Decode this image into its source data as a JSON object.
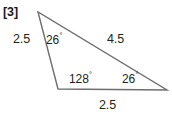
{
  "figure": {
    "index_label": "[3]",
    "shape": "triangle",
    "stroke_color": "#6d6e71",
    "text_color": "#231f20",
    "background_color": "#ffffff",
    "vertices": {
      "apex": [
        38,
        12
      ],
      "bottom_left": [
        58,
        89
      ],
      "bottom_right": [
        167,
        90
      ]
    },
    "labels": {
      "side_left": "2.5",
      "side_right": "4.5",
      "side_bottom": "2.5",
      "angle_top": "26",
      "angle_bottom_left": "128",
      "angle_bottom_right": "26",
      "degree_symbol": "°"
    }
  }
}
